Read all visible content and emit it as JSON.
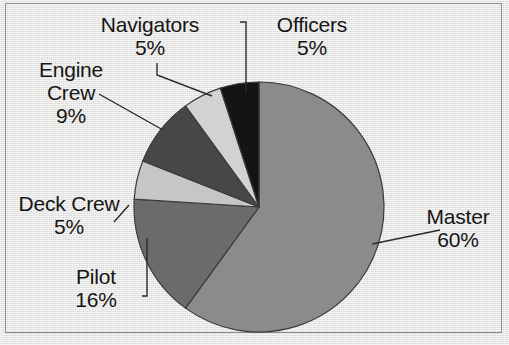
{
  "chart_data": {
    "type": "pie",
    "title": "",
    "subtitle": "",
    "xlabel": "",
    "ylabel": "",
    "legend_position": "none",
    "grid": false,
    "labels_outside": true,
    "value_unit": "%",
    "categories": [
      "Master",
      "Pilot",
      "Deck Crew",
      "Engine Crew",
      "Navigators",
      "Officers"
    ],
    "values": [
      60,
      16,
      5,
      9,
      5,
      5
    ],
    "colors": [
      "#8b8b8b",
      "#6b6b6b",
      "#c6c6c6",
      "#474747",
      "#d2d2d2",
      "#141414"
    ],
    "start_angle_deg": 0,
    "direction": "clockwise",
    "slices": [
      {
        "label": "Master",
        "value": 60,
        "value_text": "60%",
        "color": "#8b8b8b"
      },
      {
        "label": "Pilot",
        "value": 16,
        "value_text": "16%",
        "color": "#6b6b6b"
      },
      {
        "label": "Deck Crew",
        "value": 5,
        "value_text": "5%",
        "color": "#c6c6c6"
      },
      {
        "label": "Engine Crew",
        "value": 9,
        "value_text": "9%",
        "color": "#474747"
      },
      {
        "label": "Navigators",
        "value": 5,
        "value_text": "5%",
        "color": "#d2d2d2"
      },
      {
        "label": "Officers",
        "value": 5,
        "value_text": "5%",
        "color": "#141414"
      }
    ]
  },
  "labels": {
    "navigators": {
      "name": "Navigators",
      "pct": "5%"
    },
    "officers": {
      "name": "Officers",
      "pct": "5%"
    },
    "engine": {
      "name_line1": "Engine",
      "name_line2": "Crew",
      "pct": "9%"
    },
    "deck": {
      "name": "Deck Crew",
      "pct": "5%"
    },
    "pilot": {
      "name": "Pilot",
      "pct": "16%"
    },
    "master": {
      "name": "Master",
      "pct": "60%"
    }
  },
  "style": {
    "background": "#e6e6e4",
    "frame_color": "#8d8d8d",
    "text_color": "#151515",
    "leader_color": "#2a2a2a"
  }
}
